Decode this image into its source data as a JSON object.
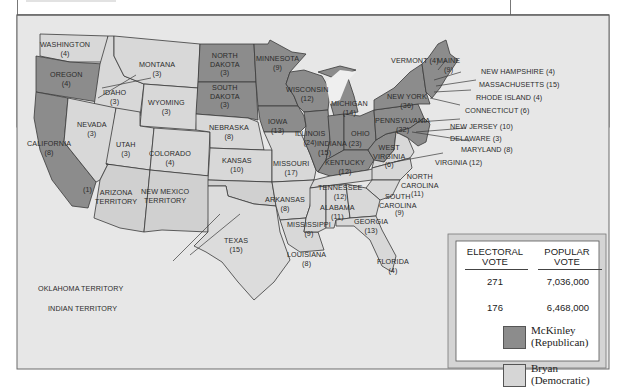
{
  "map": {
    "title": "Election of 1896",
    "colors": {
      "republican": "#8c8c8c",
      "democratic": "#d6d6d6",
      "background": "#e6e6e6",
      "border": "#3a3a3a"
    },
    "states": [
      {
        "name": "WASHINGTON",
        "votes": "(4)",
        "party": "democratic"
      },
      {
        "name": "OREGON",
        "votes": "(4)",
        "party": "republican"
      },
      {
        "name": "CALIFORNIA",
        "votes": "(8)",
        "party": "republican",
        "note": "(1)"
      },
      {
        "name": "IDAHO",
        "votes": "(3)",
        "party": "democratic"
      },
      {
        "name": "NEVADA",
        "votes": "(3)",
        "party": "democratic"
      },
      {
        "name": "MONTANA",
        "votes": "(3)",
        "party": "democratic"
      },
      {
        "name": "WYOMING",
        "votes": "(3)",
        "party": "democratic"
      },
      {
        "name": "UTAH",
        "votes": "(3)",
        "party": "democratic"
      },
      {
        "name": "COLORADO",
        "votes": "(4)",
        "party": "democratic"
      },
      {
        "name": "NORTH DAKOTA",
        "votes": "(3)",
        "party": "republican"
      },
      {
        "name": "SOUTH DAKOTA",
        "votes": "(3)",
        "party": "republican"
      },
      {
        "name": "NEBRASKA",
        "votes": "(8)",
        "party": "democratic"
      },
      {
        "name": "KANSAS",
        "votes": "(10)",
        "party": "democratic"
      },
      {
        "name": "MINNESOTA",
        "votes": "(9)",
        "party": "republican"
      },
      {
        "name": "IOWA",
        "votes": "(13)",
        "party": "republican"
      },
      {
        "name": "MISSOURI",
        "votes": "(17)",
        "party": "democratic"
      },
      {
        "name": "ARKANSAS",
        "votes": "(8)",
        "party": "democratic"
      },
      {
        "name": "TEXAS",
        "votes": "(15)",
        "party": "democratic"
      },
      {
        "name": "LOUISIANA",
        "votes": "(8)",
        "party": "democratic"
      },
      {
        "name": "WISCONSIN",
        "votes": "(12)",
        "party": "republican"
      },
      {
        "name": "ILLINOIS",
        "votes": "(24)",
        "party": "republican"
      },
      {
        "name": "MICHIGAN",
        "votes": "(14)",
        "party": "republican"
      },
      {
        "name": "INDIANA",
        "votes": "(15)",
        "party": "republican"
      },
      {
        "name": "OHIO",
        "votes": "(23)",
        "party": "republican"
      },
      {
        "name": "KENTUCKY",
        "votes": "(12)",
        "party": "republican"
      },
      {
        "name": "TENNESSEE",
        "votes": "(12)",
        "party": "democratic"
      },
      {
        "name": "MISSISSIPPI",
        "votes": "(9)",
        "party": "democratic"
      },
      {
        "name": "ALABAMA",
        "votes": "(11)",
        "party": "democratic"
      },
      {
        "name": "GEORGIA",
        "votes": "(13)",
        "party": "democratic"
      },
      {
        "name": "FLORIDA",
        "votes": "(4)",
        "party": "democratic"
      },
      {
        "name": "SOUTH CAROLINA",
        "votes": "(9)",
        "party": "democratic"
      },
      {
        "name": "NORTH CAROLINA",
        "votes": "(11)",
        "party": "democratic"
      },
      {
        "name": "VIRGINIA",
        "votes": "(12)",
        "party": "democratic"
      },
      {
        "name": "WEST VIRGINIA",
        "votes": "(6)",
        "party": "republican"
      },
      {
        "name": "PENNSYLVANIA",
        "votes": "(32)",
        "party": "republican"
      },
      {
        "name": "NEW YORK",
        "votes": "(36)",
        "party": "republican"
      },
      {
        "name": "VERMONT",
        "votes": "(4)",
        "party": "republican"
      },
      {
        "name": "MAINE",
        "votes": "(9)",
        "party": "republican"
      },
      {
        "name": "NEW HAMPSHIRE",
        "votes": "(4)",
        "party": "republican"
      },
      {
        "name": "MASSACHUSETTS",
        "votes": "(15)",
        "party": "republican"
      },
      {
        "name": "RHODE ISLAND",
        "votes": "(4)",
        "party": "republican"
      },
      {
        "name": "CONNECTICUT",
        "votes": "(6)",
        "party": "republican"
      },
      {
        "name": "NEW JERSEY",
        "votes": "(10)",
        "party": "republican"
      },
      {
        "name": "DELAWARE",
        "votes": "(3)",
        "party": "republican"
      },
      {
        "name": "MARYLAND",
        "votes": "(8)",
        "party": "republican"
      }
    ],
    "territories": [
      {
        "name": "ARIZONA TERRITORY"
      },
      {
        "name": "NEW MEXICO TERRITORY"
      },
      {
        "name": "OKLAHOMA TERRITORY"
      },
      {
        "name": "INDIAN TERRITORY"
      }
    ],
    "labels": {
      "washington": [
        "WASHINGTON",
        "(4)"
      ],
      "oregon": [
        "OREGON",
        "(4)"
      ],
      "california": [
        "CALIFORNIA",
        "(8)"
      ],
      "california_note": "(1)",
      "idaho": [
        "IDAHO",
        "(3)"
      ],
      "nevada": [
        "NEVADA",
        "(3)"
      ],
      "montana": [
        "MONTANA",
        "(3)"
      ],
      "wyoming": [
        "WYOMING",
        "(3)"
      ],
      "utah": [
        "UTAH",
        "(3)"
      ],
      "colorado": [
        "COLORADO",
        "(4)"
      ],
      "north_dakota": [
        "NORTH",
        "DAKOTA",
        "(3)"
      ],
      "south_dakota": [
        "SOUTH",
        "DAKOTA",
        "(3)"
      ],
      "nebraska": [
        "NEBRASKA",
        "(8)"
      ],
      "kansas": [
        "KANSAS",
        "(10)"
      ],
      "minnesota": [
        "MINNESOTA",
        "(9)"
      ],
      "iowa": [
        "IOWA",
        "(13)"
      ],
      "missouri": [
        "MISSOURI",
        "(17)"
      ],
      "arkansas": [
        "ARKANSAS",
        "(8)"
      ],
      "texas": [
        "TEXAS",
        "(15)"
      ],
      "louisiana": [
        "LOUISIANA",
        "(8)"
      ],
      "wisconsin": [
        "WISCONSIN",
        "(12)"
      ],
      "illinois": [
        "ILLINOIS",
        "(24)"
      ],
      "michigan": [
        "MICHIGAN",
        "(14)"
      ],
      "indiana": [
        "INDIANA (23)"
      ],
      "indiana_votes": "(15)",
      "ohio": "OHIO",
      "kentucky": [
        "KENTUCKY",
        "(12)"
      ],
      "tennessee": [
        "TENNESSEE",
        "(12)"
      ],
      "mississippi": [
        "MISSISSIPPI",
        "(9)"
      ],
      "alabama": [
        "ALABAMA",
        "(11)"
      ],
      "georgia": [
        "GEORGIA",
        "(13)"
      ],
      "florida": [
        "FLORIDA",
        "(4)"
      ],
      "south_carolina": [
        "SOUTH",
        "CAROLINA"
      ],
      "south_carolina_votes": "(9)",
      "north_carolina": [
        "NORTH",
        "CAROLINA"
      ],
      "north_carolina_votes": "(11)",
      "virginia": "VIRGINIA (12)",
      "west_virginia": [
        "WEST",
        "VIRGINIA",
        "(6)"
      ],
      "pennsylvania": [
        "PENNSYLVANIA",
        "(32)"
      ],
      "new_york": [
        "NEW YORK",
        "(36)"
      ],
      "vermont": "VERMONT (4)",
      "maine": [
        "MAINE",
        "(9)"
      ],
      "new_hampshire": "NEW HAMPSHIRE (4)",
      "massachusetts": "MASSACHUSETTS (15)",
      "rhode_island": "RHODE ISLAND (4)",
      "connecticut": "CONNECTICUT (6)",
      "new_jersey": "NEW JERSEY (10)",
      "delaware": "DELAWARE (3)",
      "maryland": "MARYLAND (8)",
      "arizona": [
        "ARIZONA",
        "TERRITORY"
      ],
      "new_mexico": [
        "NEW MEXICO",
        "TERRITORY"
      ],
      "oklahoma": "OKLAHOMA TERRITORY",
      "indian": "INDIAN TERRITORY"
    }
  },
  "legend": {
    "headers": {
      "electoral": [
        "ELECTORAL",
        "VOTE"
      ],
      "popular": [
        "POPULAR",
        "VOTE"
      ]
    },
    "rows": [
      {
        "electoral": "271",
        "popular": "7,036,000"
      },
      {
        "electoral": "176",
        "popular": "6,468,000"
      }
    ],
    "keys": [
      {
        "name": "McKinley",
        "party": "(Republican)",
        "color": "#8c8c8c"
      },
      {
        "name": "Bryan",
        "party": "(Democratic)",
        "color": "#d6d6d6"
      }
    ]
  }
}
